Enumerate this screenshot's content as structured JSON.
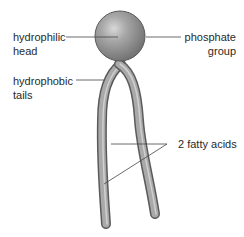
{
  "diagram": {
    "labels": {
      "hydrophilic_head": [
        "hydrophilic",
        "head"
      ],
      "phosphate_group": [
        "phosphate",
        "group"
      ],
      "hydrophobic_tails": [
        "hydrophobic",
        "tails"
      ],
      "fatty_acids": "2 fatty acids"
    },
    "colors": {
      "head_fill": "#8c8c8c",
      "tail_fill": "#9a9a9a",
      "outline": "#555555",
      "leader_line": "#444444",
      "text": "#2a2a2a"
    }
  }
}
